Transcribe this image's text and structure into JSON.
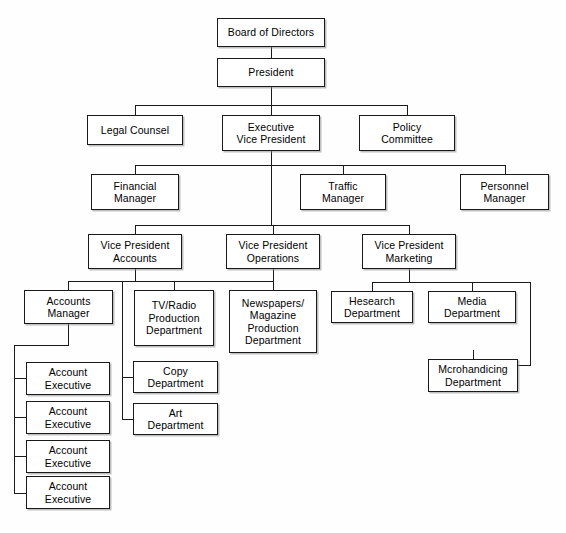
{
  "chart_data": {
    "type": "diagram",
    "orientation": "top-down",
    "node_count": 22,
    "levels": 7
  },
  "nodes": [
    {
      "id": "board",
      "label": "Board of Directors",
      "x": 217,
      "y": 18,
      "w": 108,
      "h": 29
    },
    {
      "id": "president",
      "label": "President",
      "x": 217,
      "y": 58,
      "w": 108,
      "h": 29
    },
    {
      "id": "legal",
      "label": "Legal Counsel",
      "x": 87,
      "y": 115,
      "w": 96,
      "h": 30
    },
    {
      "id": "evp",
      "label": "Executive\nVice President",
      "x": 222,
      "y": 115,
      "w": 98,
      "h": 36
    },
    {
      "id": "policy",
      "label": "Policy\nCommittee",
      "x": 359,
      "y": 115,
      "w": 96,
      "h": 36
    },
    {
      "id": "financial",
      "label": "Financial\nManager",
      "x": 91,
      "y": 174,
      "w": 88,
      "h": 36
    },
    {
      "id": "traffic",
      "label": "Traffic\nManager",
      "x": 300,
      "y": 174,
      "w": 86,
      "h": 36
    },
    {
      "id": "personnel",
      "label": "Personnel\nManager",
      "x": 460,
      "y": 174,
      "w": 89,
      "h": 36
    },
    {
      "id": "vp_accounts",
      "label": "Vice President\nAccounts",
      "x": 88,
      "y": 234,
      "w": 94,
      "h": 35
    },
    {
      "id": "vp_operations",
      "label": "Vice President\nOperations",
      "x": 226,
      "y": 234,
      "w": 94,
      "h": 35
    },
    {
      "id": "vp_marketing",
      "label": "Vice President\nMarketing",
      "x": 362,
      "y": 234,
      "w": 94,
      "h": 35
    },
    {
      "id": "acct_mgr",
      "label": "Accounts\nManager",
      "x": 24,
      "y": 290,
      "w": 89,
      "h": 34
    },
    {
      "id": "tv_radio",
      "label": "TV/Radio\nProduction\nDepartment",
      "x": 134,
      "y": 290,
      "w": 80,
      "h": 56
    },
    {
      "id": "newspapers",
      "label": "Newspapers/\nMagazine\nProduction\nDepartment",
      "x": 229,
      "y": 290,
      "w": 88,
      "h": 63
    },
    {
      "id": "research",
      "label": "Hesearch\nDepartment",
      "x": 331,
      "y": 291,
      "w": 82,
      "h": 32
    },
    {
      "id": "media",
      "label": "Media\nDepartment",
      "x": 428,
      "y": 291,
      "w": 88,
      "h": 32
    },
    {
      "id": "copy",
      "label": "Copy\nDepartment",
      "x": 133,
      "y": 361,
      "w": 85,
      "h": 32
    },
    {
      "id": "art",
      "label": "Art\nDepartment",
      "x": 133,
      "y": 403,
      "w": 85,
      "h": 32
    },
    {
      "id": "merch",
      "label": "Mcrohandicing\nDepartment",
      "x": 428,
      "y": 359,
      "w": 90,
      "h": 33
    },
    {
      "id": "ae1",
      "label": "Account\nExecutive",
      "x": 26,
      "y": 362,
      "w": 84,
      "h": 33
    },
    {
      "id": "ae2",
      "label": "Account\nExecutive",
      "x": 26,
      "y": 401,
      "w": 84,
      "h": 33
    },
    {
      "id": "ae3",
      "label": "Account\nExecutive",
      "x": 26,
      "y": 440,
      "w": 84,
      "h": 33
    },
    {
      "id": "ae4",
      "label": "Account\nExecutive",
      "x": 26,
      "y": 476,
      "w": 84,
      "h": 33
    }
  ],
  "connectors": [
    {
      "id": "board-president",
      "o": "v",
      "x": 271,
      "y": 47,
      "len": 11
    },
    {
      "id": "president-down",
      "o": "v",
      "x": 271,
      "y": 87,
      "len": 18
    },
    {
      "id": "tier2-bus",
      "o": "h",
      "x": 135,
      "y": 105,
      "len": 272
    },
    {
      "id": "legal-drop",
      "o": "v",
      "x": 135,
      "y": 105,
      "len": 10
    },
    {
      "id": "evp-drop",
      "o": "v",
      "x": 271,
      "y": 105,
      "len": 10
    },
    {
      "id": "policy-drop",
      "o": "v",
      "x": 407,
      "y": 105,
      "len": 10
    },
    {
      "id": "evp-down",
      "o": "v",
      "x": 271,
      "y": 151,
      "len": 14
    },
    {
      "id": "tier3-bus",
      "o": "h",
      "x": 135,
      "y": 165,
      "len": 370
    },
    {
      "id": "financial-drop",
      "o": "v",
      "x": 135,
      "y": 165,
      "len": 9
    },
    {
      "id": "traffic-drop",
      "o": "v",
      "x": 343,
      "y": 165,
      "len": 9
    },
    {
      "id": "personnel-drop",
      "o": "v",
      "x": 505,
      "y": 165,
      "len": 9
    },
    {
      "id": "evp-down2",
      "o": "v",
      "x": 271,
      "y": 165,
      "len": 60
    },
    {
      "id": "tier4-bus",
      "o": "h",
      "x": 135,
      "y": 225,
      "len": 274
    },
    {
      "id": "vpacct-drop",
      "o": "v",
      "x": 135,
      "y": 225,
      "len": 9
    },
    {
      "id": "vpops-drop",
      "o": "v",
      "x": 273,
      "y": 225,
      "len": 9
    },
    {
      "id": "vpmkt-drop",
      "o": "v",
      "x": 409,
      "y": 225,
      "len": 9
    },
    {
      "id": "vpacct-down",
      "o": "v",
      "x": 135,
      "y": 269,
      "len": 12
    },
    {
      "id": "vpacct-left",
      "o": "h",
      "x": 68,
      "y": 281,
      "len": 68
    },
    {
      "id": "acctmgr-drop",
      "o": "v",
      "x": 68,
      "y": 281,
      "len": 9
    },
    {
      "id": "acctmgr-down",
      "o": "v",
      "x": 68,
      "y": 324,
      "len": 21
    },
    {
      "id": "acctmgr-left",
      "o": "h",
      "x": 14,
      "y": 345,
      "len": 55
    },
    {
      "id": "ae-spine",
      "o": "v",
      "x": 14,
      "y": 345,
      "len": 148
    },
    {
      "id": "ae1-stub",
      "o": "h",
      "x": 14,
      "y": 378,
      "len": 13
    },
    {
      "id": "ae2-stub",
      "o": "h",
      "x": 14,
      "y": 417,
      "len": 13
    },
    {
      "id": "ae3-stub",
      "o": "h",
      "x": 14,
      "y": 456,
      "len": 13
    },
    {
      "id": "ae4-stub",
      "o": "h",
      "x": 14,
      "y": 493,
      "len": 13
    },
    {
      "id": "vpops-down",
      "o": "v",
      "x": 273,
      "y": 269,
      "len": 12
    },
    {
      "id": "vpops-bus",
      "o": "h",
      "x": 174,
      "y": 281,
      "len": 100
    },
    {
      "id": "tvradio-drop",
      "o": "v",
      "x": 174,
      "y": 281,
      "len": 9
    },
    {
      "id": "newspapers-drop",
      "o": "v",
      "x": 273,
      "y": 281,
      "len": 9
    },
    {
      "id": "ops-spine",
      "o": "v",
      "x": 122,
      "y": 281,
      "len": 139
    },
    {
      "id": "ops-spine-top",
      "o": "h",
      "x": 122,
      "y": 281,
      "len": 52
    },
    {
      "id": "copy-stub",
      "o": "h",
      "x": 122,
      "y": 377,
      "len": 12
    },
    {
      "id": "art-stub",
      "o": "h",
      "x": 122,
      "y": 419,
      "len": 12
    },
    {
      "id": "vpmkt-down",
      "o": "v",
      "x": 409,
      "y": 269,
      "len": 13
    },
    {
      "id": "vpmkt-bus",
      "o": "h",
      "x": 372,
      "y": 282,
      "len": 159
    },
    {
      "id": "research-drop",
      "o": "v",
      "x": 372,
      "y": 282,
      "len": 9
    },
    {
      "id": "media-drop",
      "o": "v",
      "x": 472,
      "y": 282,
      "len": 9
    },
    {
      "id": "merch-spine",
      "o": "v",
      "x": 530,
      "y": 282,
      "len": 83
    },
    {
      "id": "merch-left",
      "o": "h",
      "x": 473,
      "y": 365,
      "len": 58
    },
    {
      "id": "merch-drop",
      "o": "v",
      "x": 473,
      "y": 350,
      "len": 15
    }
  ]
}
